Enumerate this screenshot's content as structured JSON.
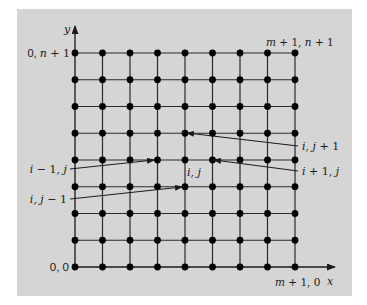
{
  "figure": {
    "background_color": "#ffffff",
    "panel": {
      "x": 17,
      "y": 9,
      "width": 335,
      "height": 287,
      "fill": "#d5d5d5"
    },
    "grid": {
      "columns": 9,
      "rows": 9,
      "origin_x": 75,
      "origin_y": 267,
      "col_spacing": 27.5,
      "row_spacing": 26.75,
      "line_color": "#2a2a2a",
      "node_color": "#000000",
      "node_radius": 3.4
    },
    "axes": {
      "x_label": "x",
      "y_label": "y",
      "x_axis_end": 335,
      "y_axis_end": 26
    },
    "corner_labels": {
      "top_left": "0, n + 1",
      "top_left_parts": [
        "0, ",
        "n",
        " + 1"
      ],
      "top_right": "m + 1, n + 1",
      "top_right_parts": [
        "m",
        " + 1, ",
        "n",
        " + 1"
      ],
      "bottom_left": "0, 0",
      "bottom_right": "m + 1, 0",
      "bottom_right_parts": [
        "m",
        " + 1, 0"
      ]
    },
    "node_labels": {
      "center": "i, j",
      "center_parts": [
        "i, j"
      ],
      "up": "i, j + 1",
      "up_parts": [
        "i, j",
        " + 1"
      ],
      "right": "i + 1, j",
      "right_parts": [
        "i",
        " + 1, ",
        "j"
      ],
      "left": "i − 1, j",
      "left_parts": [
        "i",
        " − 1, ",
        "j"
      ],
      "down": "i, j − 1",
      "down_parts": [
        "i, j",
        " − 1"
      ]
    },
    "annotations": [
      {
        "id": "up",
        "label": "i, j + 1",
        "from": [
          298,
          146
        ],
        "to": [
          187,
          133
        ]
      },
      {
        "id": "right",
        "label": "i + 1, j",
        "from": [
          298,
          171
        ],
        "to": [
          214,
          160
        ]
      },
      {
        "id": "left",
        "label": "i − 1, j",
        "from": [
          70,
          169
        ],
        "to": [
          154,
          160
        ]
      },
      {
        "id": "down",
        "label": "i, j − 1",
        "from": [
          70,
          199
        ],
        "to": [
          182,
          187
        ]
      }
    ]
  }
}
